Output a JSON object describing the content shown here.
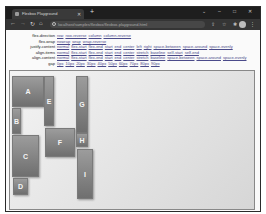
{
  "browser": {
    "tab_title": "Flexbox Playground",
    "new_tab_label": "+",
    "address": "localhost/samples/flexbox/flexbox-playground.html",
    "window_controls": {
      "minimize": "–",
      "maximize": "□",
      "close": "✕",
      "tablist": "⌄"
    }
  },
  "controls": [
    {
      "label": "flex-direction",
      "options": [
        "row",
        "row-reverse",
        "column",
        "column-reverse"
      ]
    },
    {
      "label": "flex-wrap",
      "options": [
        "nowrap",
        "wrap",
        "wrap-reverse"
      ]
    },
    {
      "label": "justify-content",
      "options": [
        "normal",
        "flex-start",
        "flex-end",
        "start",
        "end",
        "center",
        "left",
        "right",
        "space-between",
        "space-around",
        "space-evenly"
      ]
    },
    {
      "label": "align-items",
      "options": [
        "normal",
        "flex-start",
        "flex-end",
        "start",
        "end",
        "center",
        "stretch",
        "baseline",
        "self-start",
        "self-end"
      ]
    },
    {
      "label": "align-content",
      "options": [
        "normal",
        "flex-start",
        "flex-end",
        "start",
        "end",
        "center",
        "stretch",
        "baseline",
        "space-between",
        "space-around",
        "space-evenly"
      ]
    },
    {
      "label": "gap",
      "options": [
        "0px",
        "10px",
        "20px",
        "30px",
        "40px",
        "50px",
        "60px",
        "70px",
        "80px",
        "90px"
      ]
    }
  ],
  "items": [
    "A",
    "B",
    "C",
    "D",
    "E",
    "F",
    "G",
    "H",
    "I"
  ]
}
